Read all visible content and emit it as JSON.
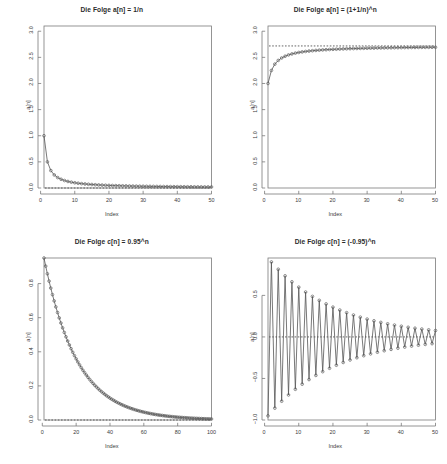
{
  "figure": {
    "layout": "2x2 grid of R base-graphics sequence plots",
    "background": "#ffffff",
    "axis_color": "#7a7a7a",
    "series_color": "#555555",
    "limit_line_color": "#333333",
    "marker": "open-circle"
  },
  "panels": [
    {
      "id": "panel-a-1-over-n",
      "title": "Die Folge a[n] = 1/n",
      "xlabel": "Index",
      "ylabel": "a[n]"
    },
    {
      "id": "panel-a-euler",
      "title": "Die Folge a[n] = (1+1/n)^n",
      "xlabel": "Index",
      "ylabel": "a[n]"
    },
    {
      "id": "panel-c-095",
      "title": "Die Folge c[n] = 0.95^n",
      "xlabel": "Index",
      "ylabel": "a[n]"
    },
    {
      "id": "panel-c-neg095",
      "title": "Die Folge c[n] = (-0.95)^n",
      "xlabel": "Index",
      "ylabel": "a[n]"
    }
  ],
  "chart_data": [
    {
      "type": "line",
      "title": "Die Folge a[n] = 1/n",
      "xlabel": "Index",
      "ylabel": "a[n]",
      "xlim": [
        1,
        50
      ],
      "ylim": [
        0.0,
        3.1
      ],
      "xticks": [
        0,
        10,
        20,
        30,
        40,
        50
      ],
      "yticks": [
        0.0,
        0.5,
        1.0,
        1.5,
        2.0,
        2.5,
        3.0
      ],
      "grid": false,
      "legend": "none",
      "marker": "open-circle",
      "annotations": [
        {
          "kind": "hline",
          "y": 0,
          "style": "dashed",
          "label": "limit 0"
        }
      ],
      "x": [
        1,
        2,
        3,
        4,
        5,
        6,
        7,
        8,
        9,
        10,
        11,
        12,
        13,
        14,
        15,
        16,
        17,
        18,
        19,
        20,
        21,
        22,
        23,
        24,
        25,
        26,
        27,
        28,
        29,
        30,
        31,
        32,
        33,
        34,
        35,
        36,
        37,
        38,
        39,
        40,
        41,
        42,
        43,
        44,
        45,
        46,
        47,
        48,
        49,
        50
      ],
      "values": [
        1,
        0.5,
        0.3333,
        0.25,
        0.2,
        0.1667,
        0.1429,
        0.125,
        0.1111,
        0.1,
        0.0909,
        0.0833,
        0.0769,
        0.0714,
        0.0667,
        0.0625,
        0.0588,
        0.0556,
        0.0526,
        0.05,
        0.0476,
        0.0455,
        0.0435,
        0.0417,
        0.04,
        0.0385,
        0.037,
        0.0357,
        0.0345,
        0.0333,
        0.0323,
        0.0313,
        0.0303,
        0.0294,
        0.0286,
        0.0278,
        0.027,
        0.0263,
        0.0256,
        0.025,
        0.0244,
        0.0238,
        0.0233,
        0.0227,
        0.0222,
        0.0217,
        0.0213,
        0.0208,
        0.0204,
        0.02
      ]
    },
    {
      "type": "line",
      "title": "Die Folge a[n] = (1+1/n)^n",
      "xlabel": "Index",
      "ylabel": "a[n]",
      "xlim": [
        1,
        50
      ],
      "ylim": [
        0.0,
        3.1
      ],
      "xticks": [
        0,
        10,
        20,
        30,
        40,
        50
      ],
      "yticks": [
        0.0,
        0.5,
        1.0,
        1.5,
        2.0,
        2.5,
        3.0
      ],
      "grid": false,
      "legend": "none",
      "marker": "open-circle",
      "annotations": [
        {
          "kind": "hline",
          "y": 2.71828,
          "style": "dashed",
          "label": "limit e"
        }
      ],
      "x": [
        1,
        2,
        3,
        4,
        5,
        6,
        7,
        8,
        9,
        10,
        11,
        12,
        13,
        14,
        15,
        16,
        17,
        18,
        19,
        20,
        21,
        22,
        23,
        24,
        25,
        26,
        27,
        28,
        29,
        30,
        31,
        32,
        33,
        34,
        35,
        36,
        37,
        38,
        39,
        40,
        41,
        42,
        43,
        44,
        45,
        46,
        47,
        48,
        49,
        50
      ],
      "values": [
        2.0,
        2.25,
        2.3704,
        2.4414,
        2.4883,
        2.5216,
        2.5465,
        2.5658,
        2.5812,
        2.5937,
        2.6042,
        2.613,
        2.6206,
        2.6272,
        2.6329,
        2.6379,
        2.6424,
        2.6464,
        2.65,
        2.6533,
        2.6563,
        2.6591,
        2.6616,
        2.6639,
        2.6661,
        2.6681,
        2.6699,
        2.6717,
        2.6733,
        2.6749,
        2.6763,
        2.6777,
        2.679,
        2.6802,
        2.6813,
        2.6824,
        2.6835,
        2.6845,
        2.6854,
        2.6863,
        2.6872,
        2.688,
        2.6888,
        2.6896,
        2.6903,
        2.691,
        2.6917,
        2.6924,
        2.693,
        2.6936
      ]
    },
    {
      "type": "line",
      "title": "Die Folge c[n] = 0.95^n",
      "xlabel": "Index",
      "ylabel": "a[n]",
      "xlim": [
        1,
        100
      ],
      "ylim": [
        0.0,
        0.95
      ],
      "xticks": [
        0,
        20,
        40,
        60,
        80,
        100
      ],
      "yticks": [
        0.0,
        0.2,
        0.4,
        0.6,
        0.8
      ],
      "grid": false,
      "legend": "none",
      "marker": "open-circle",
      "annotations": [
        {
          "kind": "hline",
          "y": 0,
          "style": "dashed",
          "label": "limit 0"
        }
      ],
      "formula": "0.95^n for n = 1..100",
      "values_sample": [
        0.95,
        0.9025,
        0.8574,
        0.8145,
        0.7738,
        0.5987,
        0.3585,
        0.2146,
        0.1285,
        0.0769,
        0.046,
        0.0276,
        0.0165,
        0.0099,
        0.0059
      ]
    },
    {
      "type": "line",
      "title": "Die Folge c[n] = (-0.95)^n",
      "xlabel": "Index",
      "ylabel": "a[n]",
      "xlim": [
        1,
        50
      ],
      "ylim": [
        -1.0,
        0.95
      ],
      "xticks": [
        0,
        10,
        20,
        30,
        40,
        50
      ],
      "yticks": [
        -1.0,
        -0.5,
        0.0,
        0.5
      ],
      "grid": false,
      "legend": "none",
      "marker": "open-circle",
      "annotations": [
        {
          "kind": "hline",
          "y": 0,
          "style": "dashed",
          "label": "limit 0"
        }
      ],
      "formula": "(-0.95)^n for n = 1..50",
      "values_sample": [
        -0.95,
        0.9025,
        -0.8574,
        0.8145,
        -0.7738,
        0.7351,
        -0.6983,
        0.6634,
        -0.6302,
        0.5987
      ]
    }
  ]
}
